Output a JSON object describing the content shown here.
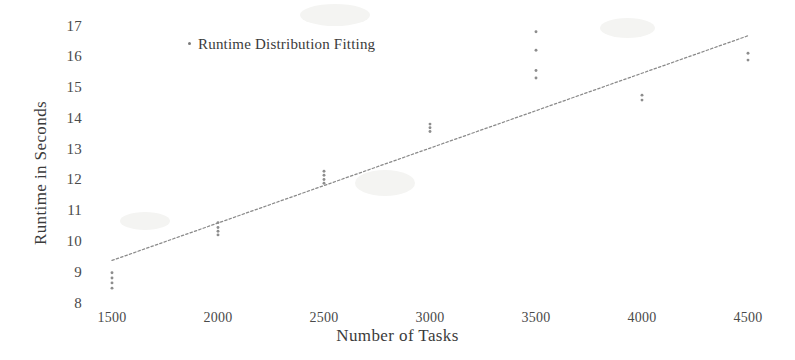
{
  "chart_data": {
    "type": "scatter",
    "title": "",
    "xlabel": "Number of Tasks",
    "ylabel": "Runtime in Seconds",
    "xlim": [
      1400,
      4600
    ],
    "ylim": [
      8,
      17
    ],
    "xticks": [
      1500,
      2000,
      2500,
      3000,
      3500,
      4000,
      4500
    ],
    "yticks": [
      8,
      9,
      10,
      11,
      12,
      13,
      14,
      15,
      16,
      17
    ],
    "grid": false,
    "legend_position": "upper-left-inside",
    "legend": [
      {
        "label": "Runtime Distribution Fitting",
        "marker": "dot",
        "color": "#8d8d8d"
      }
    ],
    "series": [
      {
        "name": "Runtime Distribution Fitting",
        "marker": "dot",
        "color": "#8d8d8d",
        "points": [
          {
            "x": 1500,
            "y": 8.95
          },
          {
            "x": 1500,
            "y": 8.78
          },
          {
            "x": 1500,
            "y": 8.62
          },
          {
            "x": 1500,
            "y": 8.45
          },
          {
            "x": 2000,
            "y": 10.58
          },
          {
            "x": 2000,
            "y": 10.42
          },
          {
            "x": 2000,
            "y": 10.3
          },
          {
            "x": 2000,
            "y": 10.18
          },
          {
            "x": 2500,
            "y": 12.25
          },
          {
            "x": 2500,
            "y": 12.12
          },
          {
            "x": 2500,
            "y": 11.98
          },
          {
            "x": 2500,
            "y": 11.86
          },
          {
            "x": 3000,
            "y": 13.78
          },
          {
            "x": 3000,
            "y": 13.66
          },
          {
            "x": 3000,
            "y": 13.54
          },
          {
            "x": 3500,
            "y": 16.78
          },
          {
            "x": 3500,
            "y": 16.18
          },
          {
            "x": 3500,
            "y": 15.52
          },
          {
            "x": 3500,
            "y": 15.28
          },
          {
            "x": 4000,
            "y": 14.72
          },
          {
            "x": 4000,
            "y": 14.56
          },
          {
            "x": 4500,
            "y": 16.08
          },
          {
            "x": 4500,
            "y": 15.86
          }
        ]
      }
    ],
    "trendline": {
      "name": "linear fit",
      "style": "dashed",
      "color": "#8a8a8a",
      "x_start": 1500,
      "y_start": 9.35,
      "x_end": 4500,
      "y_end": 16.65,
      "slope_per_task": 0.002433,
      "intercept": 5.7
    }
  },
  "axes": {
    "y_tick_labels": [
      "17",
      "16",
      "15",
      "14",
      "13",
      "12",
      "11",
      "10",
      "9",
      "8"
    ],
    "x_tick_labels": [
      "1500",
      "2000",
      "2500",
      "3000",
      "3500",
      "4000",
      "4500"
    ],
    "y_axis_title": "Runtime in Seconds",
    "x_axis_title": "Number of Tasks"
  },
  "legend": {
    "marker_name": "scatter-dot-marker",
    "label": "Runtime Distribution Fitting"
  }
}
